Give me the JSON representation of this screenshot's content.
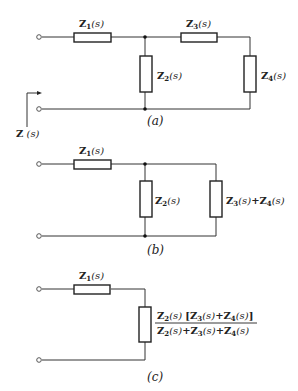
{
  "figure": {
    "circuits": [
      {
        "id": "a",
        "caption": "(a)",
        "components": [
          {
            "name": "Z1",
            "label": "Z",
            "sub": "1",
            "arg": "(s)",
            "orientation": "horizontal",
            "position": "series-input"
          },
          {
            "name": "Z2",
            "label": "Z",
            "sub": "2",
            "arg": "(s)",
            "orientation": "vertical",
            "position": "shunt"
          },
          {
            "name": "Z3",
            "label": "Z",
            "sub": "3",
            "arg": "(s)",
            "orientation": "horizontal",
            "position": "series"
          },
          {
            "name": "Z4",
            "label": "Z",
            "sub": "4",
            "arg": "(s)",
            "orientation": "vertical",
            "position": "shunt-end"
          }
        ],
        "input_impedance_label": {
          "label": "Z",
          "arg": " (s)"
        }
      },
      {
        "id": "b",
        "caption": "(b)",
        "components": [
          {
            "name": "Z1",
            "label": "Z",
            "sub": "1",
            "arg": "(s)"
          },
          {
            "name": "Z2",
            "label": "Z",
            "sub": "2",
            "arg": "(s)"
          },
          {
            "name": "Z3+Z4",
            "text": "Z3(s)+Z4(s)"
          }
        ]
      },
      {
        "id": "c",
        "caption": "(c)",
        "components": [
          {
            "name": "Z1",
            "label": "Z",
            "sub": "1",
            "arg": "(s)"
          },
          {
            "name": "Zeq",
            "numerator": "Z2(s) [Z3(s)+Z4(s)]",
            "denominator": "Z2(s)+Z3(s)+Z4(s)"
          }
        ]
      }
    ]
  }
}
